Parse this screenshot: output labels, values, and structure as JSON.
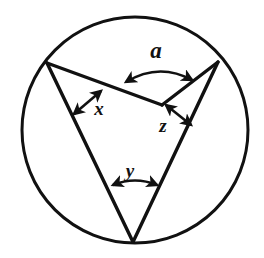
{
  "figure": {
    "canvas": {
      "width": 264,
      "height": 258,
      "background": "#ffffff"
    },
    "stroke_color": "#111111",
    "circle": {
      "cx": 135,
      "cy": 130,
      "r": 113,
      "stroke_width": 3
    },
    "points": {
      "left_vertex": {
        "x": 47,
        "y": 63
      },
      "right_vertex": {
        "x": 218,
        "y": 62
      },
      "bottom_vertex": {
        "x": 133,
        "y": 242
      },
      "notch_vertex": {
        "x": 162,
        "y": 105
      }
    },
    "segments": [
      {
        "name": "left-to-bottom",
        "from": "left_vertex",
        "to": "bottom_vertex"
      },
      {
        "name": "left-to-notch",
        "from": "left_vertex",
        "to": "notch_vertex"
      },
      {
        "name": "notch-to-right",
        "from": "notch_vertex",
        "to": "right_vertex"
      },
      {
        "name": "right-to-bottom",
        "from": "right_vertex",
        "to": "bottom_vertex"
      }
    ],
    "angle_labels": [
      {
        "id": "a",
        "text": "a",
        "at_vertex": "notch_vertex",
        "label_x": 156,
        "label_y": 58,
        "font_size": 23,
        "marker": "double-headed-arc",
        "arc": {
          "start_x": 126,
          "start_y": 82,
          "end_x": 192,
          "end_y": 80,
          "peak_y": 62
        }
      },
      {
        "id": "x",
        "text": "x",
        "at_vertex": "left_vertex",
        "label_x": 99,
        "label_y": 115,
        "font_size": 19,
        "marker": "double-headed-straight",
        "line": {
          "x1": 74,
          "y1": 114,
          "x2": 101,
          "y2": 91
        }
      },
      {
        "id": "z",
        "text": "z",
        "at_vertex": "right_vertex",
        "label_x": 163,
        "label_y": 132,
        "font_size": 19,
        "marker": "double-headed-straight",
        "line": {
          "x1": 166,
          "y1": 105,
          "x2": 191,
          "y2": 125
        }
      },
      {
        "id": "y",
        "text": "y",
        "at_vertex": "bottom_vertex",
        "label_x": 130,
        "label_y": 177,
        "font_size": 19,
        "marker": "double-headed-arc",
        "arc": {
          "start_x": 113,
          "start_y": 185,
          "end_x": 157,
          "end_y": 185,
          "peak_y": 176
        }
      }
    ]
  }
}
